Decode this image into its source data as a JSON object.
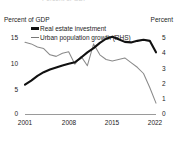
{
  "clipped_header": "Percent of GDP",
  "axes": {
    "lhs_unit": "Percent of GDP",
    "rhs_unit": "Percent",
    "lhs_ticks": [
      "15",
      "10",
      "5",
      "0"
    ],
    "rhs_ticks": [
      "5",
      "4",
      "3",
      "2",
      "1",
      "0"
    ],
    "x_ticks": [
      "2001",
      "2008",
      "2015",
      "2022"
    ]
  },
  "legend": {
    "items": [
      {
        "label": "Real estate investment",
        "style": "thick",
        "color": "#111111"
      },
      {
        "label": "Urban population growth (RHS)",
        "style": "thin",
        "color": "#8a8a8a"
      }
    ]
  },
  "chart_data": {
    "type": "line",
    "title": "",
    "xlabel": "",
    "ylabel": "Percent of GDP",
    "y2label": "Percent",
    "xlim": [
      2001,
      2022
    ],
    "ylim": [
      0,
      15.5
    ],
    "y2lim": [
      0,
      5.2
    ],
    "grid": false,
    "legend_position": "top-left",
    "x": [
      2001,
      2002,
      2003,
      2004,
      2005,
      2006,
      2007,
      2008,
      2009,
      2010,
      2011,
      2012,
      2013,
      2014,
      2015,
      2016,
      2017,
      2018,
      2019,
      2020,
      2021,
      2022
    ],
    "series": [
      {
        "name": "Real estate investment",
        "axis": "left",
        "unit": "Percent of GDP",
        "color": "#111111",
        "values": [
          5.6,
          6.4,
          7.3,
          8.0,
          8.5,
          8.9,
          9.3,
          9.6,
          9.9,
          10.8,
          11.8,
          12.6,
          13.6,
          14.4,
          14.8,
          14.3,
          13.8,
          13.7,
          14.0,
          14.2,
          14.0,
          11.8
        ]
      },
      {
        "name": "Urban population growth (RHS)",
        "axis": "right",
        "unit": "Percent",
        "color": "#8a8a8a",
        "values": [
          4.6,
          4.5,
          4.3,
          4.2,
          3.8,
          3.7,
          3.9,
          4.0,
          3.2,
          3.7,
          3.1,
          4.5,
          3.8,
          3.5,
          3.4,
          3.5,
          3.6,
          3.3,
          3.0,
          2.6,
          1.7,
          0.7
        ]
      }
    ]
  }
}
